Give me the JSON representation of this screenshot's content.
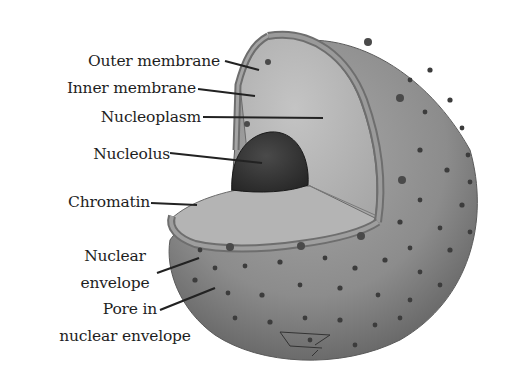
{
  "diagram": {
    "labels": {
      "outer_membrane": "Outer membrane",
      "inner_membrane": "Inner membrane",
      "nucleoplasm": "Nucleoplasm",
      "nucleolus": "Nucleolus",
      "chromatin": "Chromatin",
      "nuclear_envelope_line1": "Nuclear",
      "nuclear_envelope_line2": "envelope",
      "pore_line1": "Pore in",
      "pore_line2": "nuclear envelope"
    },
    "colors": {
      "background": "#ffffff",
      "sphere_surface": "#8a8a8a",
      "sphere_shadow": "#5e5e5e",
      "cut_face": "#b8b8b8",
      "membrane_band": "#7a7a7a",
      "nucleolus": "#3a3a3a",
      "text": "#1e1e1e",
      "leader_line": "#222222"
    }
  }
}
